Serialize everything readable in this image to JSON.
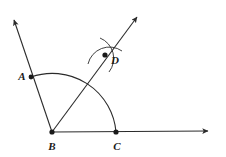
{
  "figure": {
    "name": "angle-bisector-construction",
    "background_color": "#ffffff",
    "stroke_color": "#2b2b2b",
    "label_color": "#1a1a1a",
    "width": 226,
    "height": 157,
    "points": [
      {
        "id": "A",
        "label": "A",
        "x": 31,
        "y": 77,
        "label_x": 22,
        "label_y": 80,
        "dot": true
      },
      {
        "id": "B",
        "label": "B",
        "x": 52,
        "y": 132,
        "label_x": 52,
        "label_y": 150,
        "dot": true
      },
      {
        "id": "C",
        "label": "C",
        "x": 116,
        "y": 132,
        "label_x": 117,
        "label_y": 150,
        "dot": true
      },
      {
        "id": "D",
        "label": "D",
        "x": 105,
        "y": 55,
        "label_x": 115,
        "label_y": 64,
        "dot": true
      }
    ],
    "rays": [
      {
        "id": "ray-BA",
        "from": "B",
        "through": "A",
        "x1": 52,
        "y1": 132,
        "x2": 12,
        "y2": 18,
        "arrow": "end"
      },
      {
        "id": "ray-BC",
        "from": "B",
        "through": "C",
        "x1": 52,
        "y1": 132,
        "x2": 211,
        "y2": 131,
        "arrow": "end"
      },
      {
        "id": "ray-BD",
        "from": "B",
        "through": "D",
        "x1": 52,
        "y1": 132,
        "x2": 139,
        "y2": 15,
        "arrow": "end"
      }
    ],
    "arcs": [
      {
        "id": "main-arc-AC",
        "center": "B",
        "radius": 64,
        "from_point": "A",
        "to_point": "C"
      },
      {
        "id": "construction-arc-1",
        "near": "D"
      },
      {
        "id": "construction-arc-2",
        "near": "D"
      }
    ]
  }
}
